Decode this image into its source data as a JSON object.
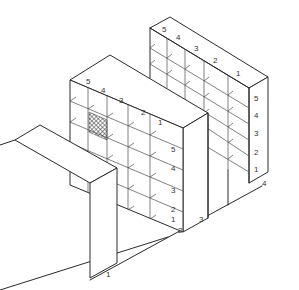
{
  "figure": {
    "type": "isometric technical line drawing",
    "colors": {
      "line": "#2a2a2a",
      "background": "#ffffff",
      "hatch": "#333333"
    }
  },
  "back_unit": {
    "column_labels": [
      "5",
      "4",
      "3",
      "2",
      "1"
    ],
    "shelf_labels": [
      "5",
      "4",
      "3",
      "2",
      "1"
    ]
  },
  "front_unit": {
    "column_labels": [
      "5",
      "4",
      "3",
      "2",
      "1"
    ],
    "shelf_labels": [
      "5",
      "4",
      "3",
      "2",
      "1"
    ],
    "highlighted_cell": {
      "column": "4",
      "shelf": "4",
      "pattern": "cross-hatch"
    }
  },
  "rail_labels": [
    "1",
    "2",
    "3",
    "4"
  ]
}
